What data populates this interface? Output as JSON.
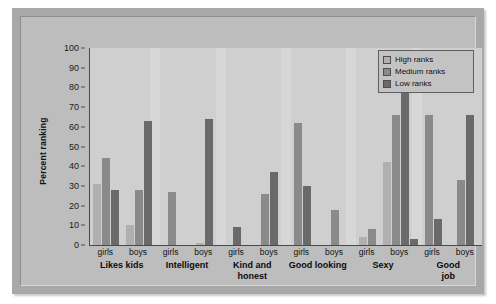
{
  "chart_data": {
    "type": "bar",
    "title": "",
    "subtitle": "",
    "xlabel": "",
    "ylabel": "Percent ranking",
    "ylim": [
      0,
      100
    ],
    "yticks": [
      0,
      10,
      20,
      30,
      40,
      50,
      60,
      70,
      80,
      90,
      100
    ],
    "grid": false,
    "legend_position": "top-right",
    "categories": [
      "Likes kids",
      "Intelligent",
      "Kind and honest",
      "Good looking",
      "Sexy",
      "Good job"
    ],
    "subgroups": [
      "girls",
      "boys"
    ],
    "series": [
      {
        "name": "High ranks",
        "color": "#b0b0b0",
        "values": {
          "girls": [
            31,
            0,
            0,
            0,
            0,
            0
          ],
          "boys": [
            0,
            0,
            0,
            0,
            4,
            0
          ]
        }
      },
      {
        "name": "Medium ranks",
        "color": "#8a8a8a",
        "values": {
          "girls": [
            44,
            27,
            0,
            62,
            8,
            66
          ],
          "boys": [
            10,
            1,
            26,
            18,
            66,
            33
          ]
        }
      },
      {
        "name": "Low ranks",
        "color": "#6a6a6a",
        "values": {
          "girls": [
            28,
            0,
            9,
            30,
            0,
            13
          ],
          "boys": [
            63,
            64,
            37,
            0,
            82,
            66
          ]
        }
      }
    ],
    "groups": [
      {
        "category": "Likes kids",
        "girls": {
          "High ranks": 31,
          "Medium ranks": 44,
          "Low ranks": 28
        },
        "boys": {
          "Medium ranks": 10,
          "Low ranks": 28,
          "Low ranks 2": 63
        }
      },
      {
        "category": "Intelligent",
        "girls": {
          "Medium ranks": 27
        },
        "boys": {
          "Medium ranks": 1,
          "Low ranks": 64
        }
      },
      {
        "category": "Kind and honest",
        "girls": {
          "Low ranks": 9
        },
        "boys": {
          "Low ranks": 37,
          "Medium ranks": 26
        }
      },
      {
        "category": "Good looking",
        "girls": {
          "Medium ranks": 62,
          "Low ranks": 30
        },
        "boys": {
          "Medium ranks": 18
        }
      },
      {
        "category": "Sexy",
        "girls": {
          "High ranks": 4,
          "Medium ranks": 8
        },
        "boys": {
          "Low ranks": 82,
          "Medium ranks": 66,
          "High ranks": 42
        }
      },
      {
        "category": "Good job",
        "girls": {
          "Medium ranks": 66,
          "Low ranks": 13
        },
        "boys": {
          "Medium ranks": 33,
          "Low ranks": 66
        }
      }
    ],
    "bars": [
      {
        "group": "Likes kids",
        "sub": "girls",
        "series": "High ranks",
        "value": 31
      },
      {
        "group": "Likes kids",
        "sub": "girls",
        "series": "Medium ranks",
        "value": 44
      },
      {
        "group": "Likes kids",
        "sub": "girls",
        "series": "Low ranks",
        "value": 28
      },
      {
        "group": "Likes kids",
        "sub": "boys",
        "series": "High ranks",
        "value": 10
      },
      {
        "group": "Likes kids",
        "sub": "boys",
        "series": "Medium ranks",
        "value": 28
      },
      {
        "group": "Likes kids",
        "sub": "boys",
        "series": "Low ranks",
        "value": 63
      },
      {
        "group": "Intelligent",
        "sub": "girls",
        "series": "Medium ranks",
        "value": 27
      },
      {
        "group": "Intelligent",
        "sub": "boys",
        "series": "High ranks",
        "value": 1
      },
      {
        "group": "Intelligent",
        "sub": "boys",
        "series": "Low ranks",
        "value": 64
      },
      {
        "group": "Kind and honest",
        "sub": "girls",
        "series": "Low ranks",
        "value": 9
      },
      {
        "group": "Kind and honest",
        "sub": "boys",
        "series": "Low ranks",
        "value": 37
      },
      {
        "group": "Kind and honest",
        "sub": "boys",
        "series": "Medium ranks",
        "value": 26
      },
      {
        "group": "Good looking",
        "sub": "girls",
        "series": "Medium ranks",
        "value": 62
      },
      {
        "group": "Good looking",
        "sub": "girls",
        "series": "Low ranks",
        "value": 30
      },
      {
        "group": "Good looking",
        "sub": "boys",
        "series": "Medium ranks",
        "value": 18
      },
      {
        "group": "Sexy",
        "sub": "girls",
        "series": "High ranks",
        "value": 4
      },
      {
        "group": "Sexy",
        "sub": "girls",
        "series": "Medium ranks",
        "value": 8
      },
      {
        "group": "Sexy",
        "sub": "boys",
        "series": "Low ranks",
        "value": 82
      },
      {
        "group": "Sexy",
        "sub": "boys",
        "series": "Medium ranks",
        "value": 66
      },
      {
        "group": "Sexy",
        "sub": "boys",
        "series": "High ranks",
        "value": 42
      },
      {
        "group": "Sexy",
        "sub": "boys",
        "series": "Low ranks 2",
        "value": 3
      },
      {
        "group": "Good job",
        "sub": "girls",
        "series": "Medium ranks",
        "value": 66
      },
      {
        "group": "Good job",
        "sub": "girls",
        "series": "Low ranks",
        "value": 13
      },
      {
        "group": "Good job",
        "sub": "boys",
        "series": "Medium ranks",
        "value": 33
      },
      {
        "group": "Good job",
        "sub": "boys",
        "series": "Low ranks",
        "value": 66
      }
    ]
  },
  "legend": {
    "items": [
      {
        "label": "High ranks",
        "color": "#b0b0b0"
      },
      {
        "label": "Medium ranks",
        "color": "#8a8a8a"
      },
      {
        "label": "Low ranks",
        "color": "#6a6a6a"
      }
    ]
  },
  "axis": {
    "y_label": "Percent ranking",
    "y_ticks": [
      "100",
      "90",
      "80",
      "70",
      "60",
      "50",
      "40",
      "30",
      "20",
      "10",
      "0"
    ]
  },
  "x_groups": [
    {
      "label": "Likes kids",
      "girls": "girls",
      "boys": "boys"
    },
    {
      "label": "Intelligent",
      "girls": "girls",
      "boys": "boys"
    },
    {
      "label": "Kind and\nhonest",
      "girls": "girls",
      "boys": "boys"
    },
    {
      "label": "Good looking",
      "girls": "girls",
      "boys": "boys"
    },
    {
      "label": "Sexy",
      "girls": "girls",
      "boys": "boys"
    },
    {
      "label": "Good job",
      "girls": "girls",
      "boys": "boys"
    }
  ],
  "colors": {
    "page_background": "#ffffff",
    "frame_outer": "#a8a8a8",
    "frame_inner": "#bdbdbd",
    "plot_background": "#cfcfcf",
    "axis_line": "#4a4a4a",
    "text": "#111111"
  }
}
